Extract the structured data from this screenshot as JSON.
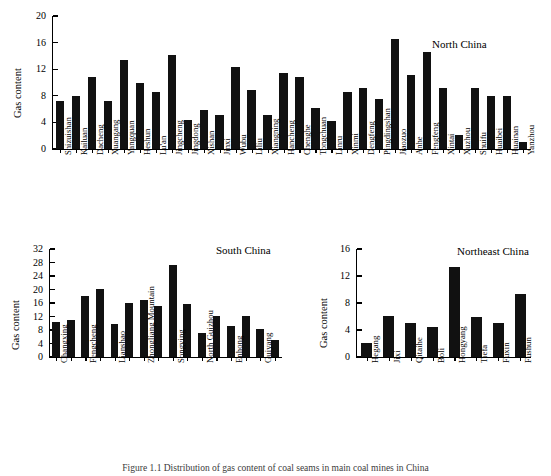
{
  "figure": {
    "caption": "Figure 1.1   Distribution of gas content of coal seams in main coal mines in China",
    "ylabel": "Gas content"
  },
  "chart_data": [
    {
      "type": "bar",
      "title": "North China",
      "xlabel": "",
      "ylabel": "Gas content",
      "ylim": [
        0,
        20
      ],
      "yticks": [
        0,
        4,
        8,
        12,
        16,
        20
      ],
      "grid": false,
      "categories": [
        "Shizuishan",
        "Kailuan",
        "Dacheng",
        "Xuangang",
        "Yangquan",
        "Heshun",
        "Lu'an",
        "Jingcheng",
        "Jingdong",
        "Xishan",
        "Jinxi",
        "Wubu",
        "Liliu",
        "Xiangning",
        "Hancheng",
        "Chenghe",
        "Tongchuan",
        "Linru",
        "Xinmi",
        "Dengfeng",
        "Pingdingshan",
        "Jiaozuo",
        "Anhe",
        "Fengfeng",
        "Xintai",
        "Xuzhou",
        "Shuifu",
        "Huaibei",
        "Huainan",
        "Yanzhou"
      ],
      "values": [
        7.2,
        7.9,
        10.9,
        7.2,
        13.4,
        10.0,
        8.5,
        14.2,
        4.4,
        5.9,
        5.1,
        12.3,
        8.8,
        5.1,
        11.4,
        10.8,
        6.1,
        4.2,
        8.5,
        9.2,
        7.5,
        16.6,
        11.1,
        14.6,
        9.2,
        2.1,
        9.2,
        7.9,
        7.9,
        1.0
      ]
    },
    {
      "type": "bar",
      "title": "South China",
      "xlabel": "",
      "ylabel": "Gas content",
      "ylim": [
        0,
        32
      ],
      "yticks": [
        0,
        4,
        8,
        12,
        16,
        20,
        24,
        28,
        32
      ],
      "grid": false,
      "categories": [
        "Changxing",
        "",
        "Fengcheng",
        "",
        "Lianshao",
        "",
        "Zhongliang Mountain",
        "",
        "Songying",
        "",
        "North Guizhou",
        "",
        "Enhong",
        "",
        "Guiyang",
        "",
        ""
      ],
      "labeled": [
        "Changxing",
        "Fengcheng",
        "Lianshao",
        "Zhongliang Mountain",
        "Songying",
        "North Guizhou",
        "Enhong",
        "Guiyang"
      ],
      "values": [
        10.4,
        10.9,
        18.1,
        20.1,
        9.9,
        15.9,
        17.0,
        15.0,
        27.2,
        15.6,
        7.0,
        12.1,
        9.3,
        12.1,
        8.2,
        5.1
      ]
    },
    {
      "type": "bar",
      "title": "Northeast China",
      "xlabel": "",
      "ylabel": "Gas content",
      "ylim": [
        0,
        16
      ],
      "yticks": [
        0,
        4,
        8,
        12,
        16
      ],
      "grid": false,
      "categories": [
        "Hegang",
        "Jixi",
        "Qitaihe",
        "Boli",
        "Hongyang",
        "Tiefa",
        "Fuxin",
        "Fushun"
      ],
      "values": [
        2.1,
        6.1,
        5.1,
        4.5,
        13.4,
        6.0,
        5.0,
        9.3
      ]
    }
  ]
}
